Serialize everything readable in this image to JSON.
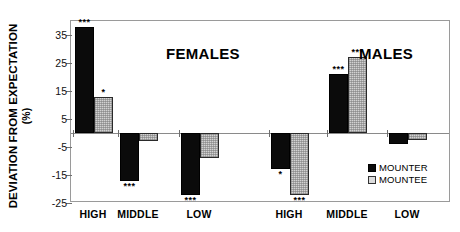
{
  "chart_data": {
    "type": "bar",
    "title": "",
    "xlabel": "",
    "ylabel": "DEVIATION FROM EXPECTATION",
    "ylabel_units": "(%)",
    "ylim": [
      -25,
      40
    ],
    "yticks": [
      35,
      25,
      15,
      5,
      -5,
      -15,
      -25
    ],
    "ytick_labels": [
      "35",
      "25",
      "15",
      "5",
      "-5",
      "-15",
      "-25"
    ],
    "grid": false,
    "legend_position": "inside-bottom-right",
    "panels": [
      {
        "name": "FEMALES",
        "categories": [
          "HIGH",
          "MIDDLE",
          "LOW"
        ]
      },
      {
        "name": "MALES",
        "categories": [
          "HIGH",
          "MIDDLE",
          "LOW"
        ]
      }
    ],
    "categories": [
      "HIGH",
      "MIDDLE",
      "LOW",
      "HIGH",
      "MIDDLE",
      "LOW"
    ],
    "series": [
      {
        "name": "MOUNTER",
        "color": "#0b0b0b",
        "values": [
          38,
          -17,
          -22,
          -13,
          21,
          -4
        ],
        "significance": [
          "***",
          "***",
          "***",
          "*",
          "***",
          ""
        ]
      },
      {
        "name": "MOUNTEE",
        "color": "#d2d2d2",
        "values": [
          13,
          -3,
          -9,
          -22,
          27,
          -2.5
        ],
        "significance": [
          "*",
          "",
          "",
          "***",
          "***",
          ""
        ]
      }
    ],
    "legend": [
      {
        "label": "MOUNTER",
        "swatch": "black-square"
      },
      {
        "label": "MOUNTEE",
        "swatch": "light-gray-square"
      }
    ],
    "significance_note": "* and *** mark deviations from expectation"
  }
}
